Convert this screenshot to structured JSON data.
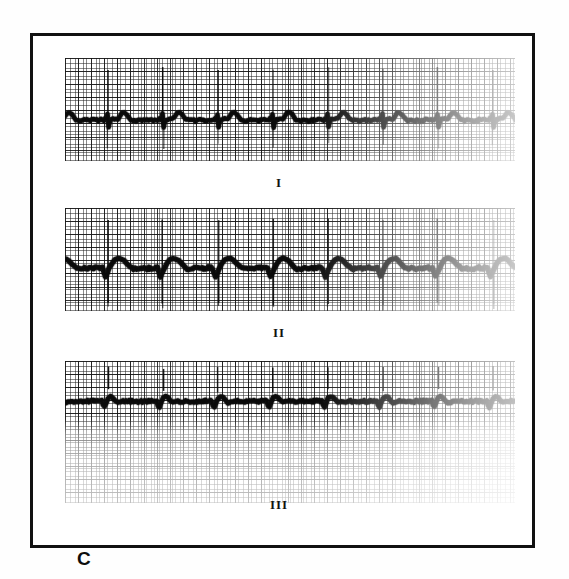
{
  "figure": {
    "panel_label": "C",
    "background_color": "#ffffff",
    "border_color": "#111111",
    "trace_color": "#0a0a0a",
    "grid_color": "#282828"
  },
  "strips": [
    {
      "lead_label": "I",
      "label_x": 276,
      "label_y": 172,
      "panel": {
        "x": 62,
        "y": 55,
        "w": 450,
        "h": 103
      },
      "grid": {
        "small_mm_px": 2.62,
        "large_mm_px": 13.1,
        "visible": true,
        "fade_from": 0.62
      },
      "calibration": {
        "speed_mm_per_s": 25,
        "gain_mm_per_mV": 10
      },
      "rhythm": {
        "beats": 8,
        "rr_interval_px": 55,
        "first_r_px": 29,
        "spike_top_px": 10,
        "spike_bottom_px": 58
      },
      "morphology": "pacemaker spikes with wide QRS, negative deflection and rounded T wave",
      "baseline_y_px": 62
    },
    {
      "lead_label": "II",
      "label_x": 276,
      "label_y": 322,
      "panel": {
        "x": 62,
        "y": 205,
        "w": 450,
        "h": 103
      },
      "grid": {
        "small_mm_px": 2.62,
        "large_mm_px": 13.1,
        "visible": true,
        "fade_from": 0.62
      },
      "calibration": {
        "speed_mm_per_s": 25,
        "gain_mm_per_mV": 10
      },
      "rhythm": {
        "beats": 8,
        "rr_interval_px": 55,
        "first_r_px": 29,
        "spike_top_px": 12,
        "spike_bottom_px": 96
      },
      "morphology": "tall pacemaker spike, broad positive R with rounded notched T wave",
      "baseline_y_px": 60
    },
    {
      "lead_label": "III",
      "label_x": 276,
      "label_y": 494,
      "panel": {
        "x": 62,
        "y": 358,
        "w": 450,
        "h": 142
      },
      "grid": {
        "small_mm_px": 2.62,
        "large_mm_px": 13.1,
        "visible": true,
        "fade_from": 0.45
      },
      "calibration": {
        "speed_mm_per_s": 25,
        "gain_mm_per_mV": 10
      },
      "rhythm": {
        "beats": 8,
        "rr_interval_px": 55,
        "first_r_px": 29,
        "spike_top_px": 6,
        "spike_bottom_px": 30
      },
      "morphology": "low amplitude biphasic complexes with small pacing spikes",
      "baseline_y_px": 40
    }
  ],
  "chart_data": {
    "type": "line",
    "title": "C",
    "xlabel": "",
    "ylabel": "",
    "paper_speed_mm_per_s": 25,
    "gain_mm_per_mV": 10,
    "series": [
      {
        "name": "I",
        "beats": 8,
        "rr_px": 55
      },
      {
        "name": "II",
        "beats": 8,
        "rr_px": 55
      },
      {
        "name": "III",
        "beats": 8,
        "rr_px": 55
      }
    ]
  }
}
